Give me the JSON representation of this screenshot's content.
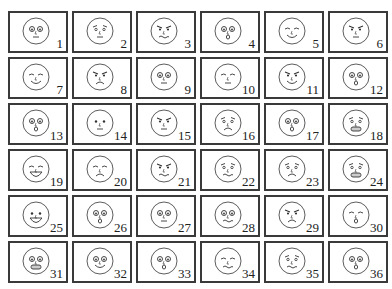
{
  "figure": {
    "rows": 6,
    "cols": 6,
    "line_color": "#333333",
    "cells": [
      {
        "n": "1",
        "expr": "neutral-small"
      },
      {
        "n": "2",
        "expr": "worried"
      },
      {
        "n": "3",
        "expr": "angry-smirk"
      },
      {
        "n": "4",
        "expr": "surprised"
      },
      {
        "n": "5",
        "expr": "wink-smirk"
      },
      {
        "n": "6",
        "expr": "stern"
      },
      {
        "n": "7",
        "expr": "content-smile"
      },
      {
        "n": "8",
        "expr": "angry-frown"
      },
      {
        "n": "9",
        "expr": "puzzled"
      },
      {
        "n": "10",
        "expr": "bored"
      },
      {
        "n": "11",
        "expr": "sly"
      },
      {
        "n": "12",
        "expr": "shocked"
      },
      {
        "n": "13",
        "expr": "tilted-curious"
      },
      {
        "n": "14",
        "expr": "looking-away"
      },
      {
        "n": "15",
        "expr": "annoyed"
      },
      {
        "n": "16",
        "expr": "sad-confused"
      },
      {
        "n": "17",
        "expr": "startled"
      },
      {
        "n": "18",
        "expr": "terrified"
      },
      {
        "n": "19",
        "expr": "laughing"
      },
      {
        "n": "20",
        "expr": "squinting-frown"
      },
      {
        "n": "21",
        "expr": "disgusted"
      },
      {
        "n": "22",
        "expr": "nervous"
      },
      {
        "n": "23",
        "expr": "distressed"
      },
      {
        "n": "24",
        "expr": "grimacing"
      },
      {
        "n": "25",
        "expr": "happy"
      },
      {
        "n": "26",
        "expr": "gasping"
      },
      {
        "n": "27",
        "expr": "wide-eyed-blank"
      },
      {
        "n": "28",
        "expr": "wavy-worried"
      },
      {
        "n": "29",
        "expr": "scowling"
      },
      {
        "n": "30",
        "expr": "kissing-eyes-closed"
      },
      {
        "n": "31",
        "expr": "anxious-grimace"
      },
      {
        "n": "32",
        "expr": "side-smirk"
      },
      {
        "n": "33",
        "expr": "sweating-panic"
      },
      {
        "n": "34",
        "expr": "crying-squint"
      },
      {
        "n": "35",
        "expr": "overwhelmed"
      },
      {
        "n": "36",
        "expr": "dazed"
      }
    ]
  }
}
